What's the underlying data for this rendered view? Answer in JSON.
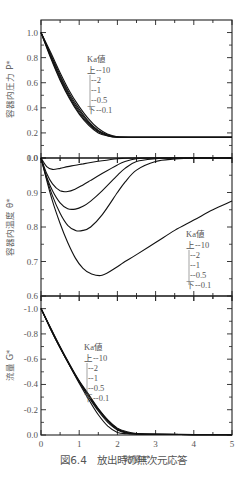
{
  "caption": "図6.4　放出時の無次元応答",
  "xlabel": "時間 t*",
  "legend": {
    "title": "Ka値",
    "entries": [
      "上--10",
      "--2",
      "--1",
      "--0.5",
      "下--0.1"
    ],
    "ka_values": [
      10,
      2,
      1,
      0.5,
      0.1
    ]
  },
  "chart_data": [
    {
      "type": "line",
      "title": "",
      "xlabel": "時間 t*",
      "ylabel": "容器内圧力 P*",
      "xlim": [
        0,
        5
      ],
      "ylim": [
        0.0,
        1.1
      ],
      "xticks": [
        0,
        1,
        2,
        3,
        4,
        5
      ],
      "yticks": [
        0.0,
        0.2,
        0.4,
        0.6,
        0.8,
        1.0
      ],
      "legend_title": "Ka値",
      "x": [
        0,
        0.25,
        0.5,
        0.75,
        1.0,
        1.25,
        1.5,
        1.75,
        2.0,
        2.5,
        3,
        4,
        5
      ],
      "series": [
        {
          "name": "Ka=10",
          "values": [
            1.0,
            0.8,
            0.62,
            0.47,
            0.35,
            0.26,
            0.2,
            0.175,
            0.165,
            0.165,
            0.165,
            0.165,
            0.165
          ]
        },
        {
          "name": "Ka=2",
          "values": [
            1.0,
            0.81,
            0.63,
            0.48,
            0.36,
            0.27,
            0.21,
            0.178,
            0.166,
            0.165,
            0.165,
            0.165,
            0.165
          ]
        },
        {
          "name": "Ka=1",
          "values": [
            1.0,
            0.82,
            0.645,
            0.495,
            0.375,
            0.28,
            0.215,
            0.18,
            0.167,
            0.165,
            0.165,
            0.165,
            0.165
          ]
        },
        {
          "name": "Ka=0.5",
          "values": [
            1.0,
            0.83,
            0.66,
            0.51,
            0.39,
            0.29,
            0.22,
            0.185,
            0.168,
            0.165,
            0.165,
            0.165,
            0.165
          ]
        },
        {
          "name": "Ka=0.1",
          "values": [
            1.0,
            0.845,
            0.68,
            0.53,
            0.41,
            0.31,
            0.235,
            0.19,
            0.17,
            0.165,
            0.165,
            0.165,
            0.165
          ]
        }
      ]
    },
    {
      "type": "line",
      "title": "",
      "xlabel": "時間 t*",
      "ylabel": "容器内温度 θ*",
      "xlim": [
        0,
        5
      ],
      "ylim": [
        0.6,
        1.0
      ],
      "xticks": [
        0,
        1,
        2,
        3,
        4,
        5
      ],
      "yticks": [
        0.6,
        0.7,
        0.8,
        0.9,
        1.0
      ],
      "legend_title": "Ka値",
      "x": [
        0,
        0.15,
        0.3,
        0.5,
        0.7,
        0.9,
        1.1,
        1.3,
        1.6,
        2.0,
        2.2,
        2.5,
        3.0,
        3.5,
        4.0,
        4.5,
        5.0
      ],
      "series": [
        {
          "name": "Ka=10",
          "values": [
            1.0,
            0.975,
            0.967,
            0.97,
            0.975,
            0.979,
            0.983,
            0.987,
            0.992,
            0.998,
            0.999,
            1.0,
            1.0,
            1.0,
            1.0,
            1.0,
            1.0
          ]
        },
        {
          "name": "Ka=2",
          "values": [
            1.0,
            0.955,
            0.925,
            0.905,
            0.903,
            0.91,
            0.922,
            0.935,
            0.955,
            0.98,
            0.99,
            0.998,
            1.0,
            1.0,
            1.0,
            1.0,
            1.0
          ]
        },
        {
          "name": "Ka=1",
          "values": [
            1.0,
            0.945,
            0.905,
            0.87,
            0.853,
            0.852,
            0.86,
            0.875,
            0.905,
            0.95,
            0.97,
            0.99,
            0.998,
            1.0,
            1.0,
            1.0,
            1.0
          ]
        },
        {
          "name": "Ka=0.5",
          "values": [
            1.0,
            0.94,
            0.89,
            0.84,
            0.805,
            0.79,
            0.79,
            0.8,
            0.835,
            0.9,
            0.93,
            0.965,
            0.99,
            0.997,
            1.0,
            1.0,
            1.0
          ]
        },
        {
          "name": "Ka=0.1",
          "values": [
            1.0,
            0.935,
            0.875,
            0.81,
            0.755,
            0.71,
            0.68,
            0.665,
            0.66,
            0.685,
            0.7,
            0.72,
            0.755,
            0.79,
            0.82,
            0.85,
            0.875
          ]
        }
      ]
    },
    {
      "type": "line",
      "title": "",
      "xlabel": "時間 t*",
      "ylabel": "流量 G*",
      "xlim": [
        0,
        5
      ],
      "ylim": [
        -1.1,
        0.0
      ],
      "xticks": [
        0,
        1,
        2,
        3,
        4,
        5
      ],
      "yticks": [
        -1.0,
        -0.8,
        -0.6,
        -0.4,
        -0.2,
        0.0
      ],
      "legend_title": "Ka値",
      "x": [
        0,
        0.25,
        0.5,
        0.75,
        1.0,
        1.25,
        1.5,
        1.75,
        2.0,
        2.25,
        2.5,
        3,
        4,
        5
      ],
      "series": [
        {
          "name": "Ka=10",
          "values": [
            -1.0,
            -0.84,
            -0.69,
            -0.55,
            -0.42,
            -0.3,
            -0.19,
            -0.1,
            -0.04,
            -0.015,
            -0.008,
            -0.005,
            -0.003,
            -0.002
          ]
        },
        {
          "name": "Ka=2",
          "values": [
            -1.0,
            -0.84,
            -0.69,
            -0.55,
            -0.42,
            -0.31,
            -0.2,
            -0.11,
            -0.045,
            -0.018,
            -0.009,
            -0.005,
            -0.003,
            -0.002
          ]
        },
        {
          "name": "Ka=1",
          "values": [
            -1.0,
            -0.845,
            -0.695,
            -0.555,
            -0.425,
            -0.31,
            -0.205,
            -0.115,
            -0.05,
            -0.02,
            -0.01,
            -0.006,
            -0.003,
            -0.002
          ]
        },
        {
          "name": "Ka=0.5",
          "values": [
            -1.0,
            -0.85,
            -0.7,
            -0.56,
            -0.43,
            -0.32,
            -0.21,
            -0.12,
            -0.055,
            -0.025,
            -0.012,
            -0.006,
            -0.003,
            -0.002
          ]
        },
        {
          "name": "Ka=0.1",
          "values": [
            -1.0,
            -0.845,
            -0.69,
            -0.55,
            -0.41,
            -0.28,
            -0.16,
            -0.07,
            -0.02,
            -0.01,
            -0.008,
            -0.006,
            -0.004,
            -0.003
          ]
        }
      ]
    }
  ]
}
